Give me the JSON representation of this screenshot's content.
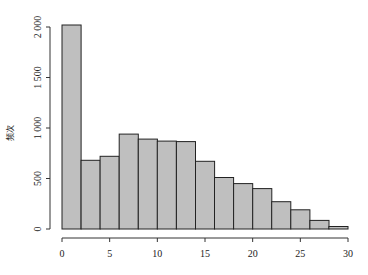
{
  "chart_data": {
    "type": "bar",
    "subtype": "histogram",
    "title": "",
    "xlabel": "",
    "ylabel": "频次",
    "bin_edges": [
      0,
      2,
      4,
      6,
      8,
      10,
      12,
      14,
      16,
      18,
      20,
      22,
      24,
      26,
      28,
      30
    ],
    "values": [
      2020,
      680,
      720,
      940,
      890,
      870,
      865,
      670,
      510,
      450,
      400,
      270,
      190,
      85,
      25
    ],
    "xlim": [
      0,
      30
    ],
    "ylim": [
      0,
      2000
    ],
    "x_ticks": [
      0,
      5,
      10,
      15,
      20,
      25,
      30
    ],
    "x_tick_labels": [
      "0",
      "5",
      "10",
      "15",
      "20",
      "25",
      "30"
    ],
    "y_ticks": [
      0,
      500,
      1000,
      1500,
      2000
    ],
    "y_tick_labels": [
      "0",
      "500",
      "1 000",
      "1 500",
      "2 000"
    ],
    "grid": false,
    "legend": "none",
    "colors": {
      "bar_fill": "#bfbfbf",
      "bar_edge": "#222222"
    }
  }
}
